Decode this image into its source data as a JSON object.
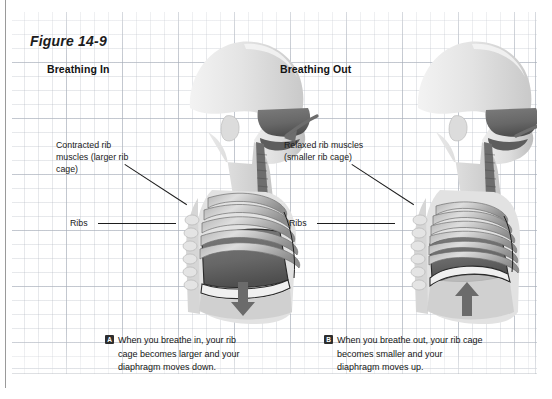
{
  "figure": {
    "title": "Figure 14-9",
    "footnote": ""
  },
  "columns": [
    {
      "id": "breathing-in",
      "heading": "Breathing In"
    },
    {
      "id": "breathing-out",
      "heading": "Breathing Out"
    }
  ],
  "callouts": {
    "left_muscles": "Contracted rib muscles (larger rib cage)",
    "right_muscles": "Relaxed rib muscles (smaller rib cage)",
    "left_ribs": "Ribs",
    "right_ribs": "Ribs"
  },
  "captions": [
    {
      "badge": "A",
      "text": "When you breathe in, your rib cage becomes larger and your diaphragm moves down."
    },
    {
      "badge": "B",
      "text": "When you breathe out, your rib cage becomes smaller and your diaphragm moves up."
    }
  ],
  "illustration": {
    "left_alt": "Side view of head and chest during inhalation with downward diaphragm arrow",
    "right_alt": "Side view of head and chest during exhalation with upward diaphragm arrow",
    "airflow_in_arrow": "arrow-into-nose",
    "airflow_out_arrow": "arrow-out-of-nose",
    "diaphragm_down_arrow": "arrow-down",
    "diaphragm_up_arrow": "arrow-up"
  },
  "colors": {
    "skin_light": "#e8e8e8",
    "skin_mid": "#d2d2d2",
    "cavity_dark": "#6e6e6e",
    "cavity_darker": "#565656",
    "rib_light": "#cfcfcf",
    "rib_shade": "#9b9b9b",
    "arrow": "#6d6d6d",
    "outline": "#1d1d1d",
    "grid": "#b4b9c2",
    "text": "#141414"
  }
}
